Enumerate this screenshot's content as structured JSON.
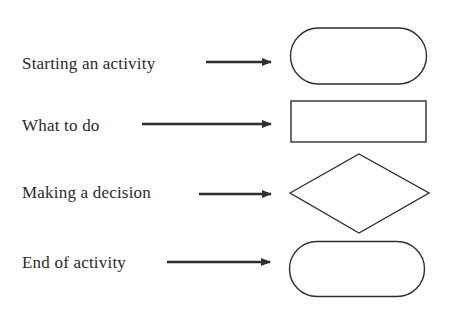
{
  "legend": {
    "title": "Flowchart symbols",
    "items": [
      {
        "label": "Starting an activity",
        "symbol": "rounded-rectangle",
        "symbol_name": "terminal-start"
      },
      {
        "label": "What to do",
        "symbol": "rectangle",
        "symbol_name": "process"
      },
      {
        "label": "Making a decision",
        "symbol": "diamond",
        "symbol_name": "decision"
      },
      {
        "label": "End of activity",
        "symbol": "rounded-rectangle",
        "symbol_name": "terminal-end"
      }
    ]
  },
  "colors": {
    "stroke": "#2e2e2e",
    "text": "#2a2a2a",
    "background": "#ffffff"
  }
}
